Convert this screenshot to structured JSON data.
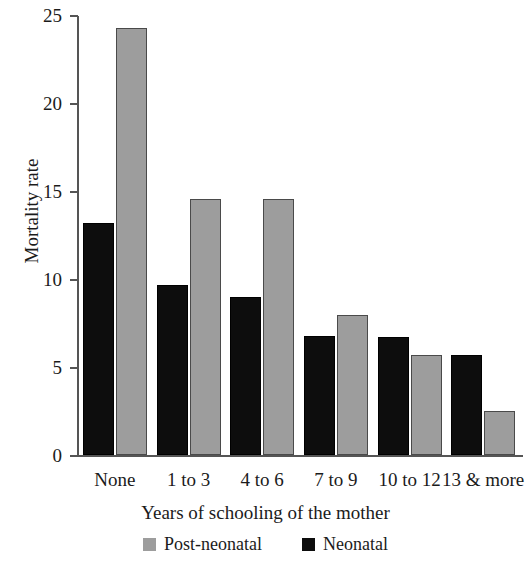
{
  "chart_data": {
    "type": "bar",
    "title": "",
    "xlabel": "Years of schooling of the mother",
    "ylabel": "Mortality rate",
    "categories": [
      "None",
      "1 to 3",
      "4 to 6",
      "7 to 9",
      "10 to 12",
      "13 & more"
    ],
    "series": [
      {
        "name": "Neonatal",
        "color": "#0d0d0d",
        "values": [
          13.2,
          9.7,
          9.0,
          6.8,
          6.7,
          5.7
        ]
      },
      {
        "name": "Post-neonatal",
        "color": "#9d9d9d",
        "values": [
          24.3,
          14.6,
          14.6,
          8.0,
          5.7,
          2.5
        ]
      }
    ],
    "series_draw_order": [
      "Neonatal",
      "Post-neonatal"
    ],
    "ylim": [
      0,
      25
    ],
    "yticks": [
      0,
      5,
      10,
      15,
      20,
      25
    ],
    "ytick_labels": [
      "0",
      "5",
      "10",
      "15",
      "20",
      "25"
    ],
    "grid": false,
    "legend_position": "bottom",
    "legend_entries": [
      "Post-neonatal",
      "Neonatal"
    ]
  },
  "axes": {
    "y_title": "Mortality rate",
    "x_title": "Years of schooling of the mother"
  },
  "legend": {
    "items": [
      {
        "label": "Post-neonatal",
        "color": "#9d9d9d"
      },
      {
        "label": "Neonatal",
        "color": "#0d0d0d"
      }
    ]
  }
}
